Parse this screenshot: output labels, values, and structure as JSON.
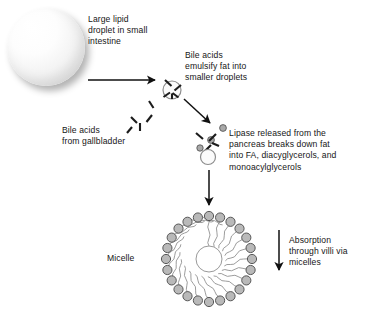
{
  "figure": {
    "background_color": "#ffffff",
    "labels": {
      "large_droplet": "Large lipid\ndroplet in small\nintestine",
      "bile_emulsify": "Bile acids\nemulsify fat into\nsmaller droplets",
      "bile_gallbladder": "Bile acids\nfrom gallbladder",
      "lipase": "Lipase released from the\npancreas breaks down fat\ninto FA, diacyglycerols, and\nmonoacylglycerols",
      "micelle": "Micelle",
      "absorption": "Absorption\nthrough villi via\nmicelles"
    },
    "colors": {
      "text": "#161616",
      "arrow": "#111111",
      "micelle_head_fill": "#b9b9b9",
      "micelle_head_stroke": "#4a4a4a",
      "micelle_tail": "#8a8a8a",
      "droplet_highlight": "#ffffff",
      "droplet_shade": "#c8c8c8",
      "bile_acid": "#1c1c1c",
      "lipase_dot": "#a9a9a9"
    },
    "shapes": {
      "large_droplet": {
        "cx": 46,
        "cy": 47,
        "r": 39
      },
      "emulsified_droplet": {
        "cx": 172,
        "cy": 90,
        "r": 9
      },
      "lipase_droplet": {
        "cx": 208,
        "cy": 157,
        "r": 7.5
      },
      "micelle": {
        "cx": 209,
        "cy": 259,
        "r_heads": 43,
        "r_core": 13,
        "head_count": 24,
        "head_r": 4.6
      }
    },
    "arrows": [
      {
        "name": "droplet-to-emulsified",
        "x1": 88,
        "y1": 80,
        "x2": 157,
        "y2": 80
      },
      {
        "name": "emulsified-to-lipase",
        "x1": 184,
        "y1": 99,
        "x2": 212,
        "y2": 125
      },
      {
        "name": "lipase-to-micelle",
        "x1": 209,
        "y1": 170,
        "x2": 209,
        "y2": 207
      },
      {
        "name": "absorption",
        "x1": 279,
        "y1": 230,
        "x2": 279,
        "y2": 272
      }
    ]
  }
}
